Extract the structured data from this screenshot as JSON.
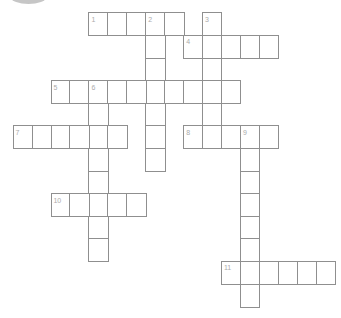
{
  "puzzle": {
    "type": "crossword",
    "colors": {
      "background": "#ffffff",
      "line": "#8f8f8f",
      "number": "#ababab",
      "logo_fragment": "#b4b4b4"
    },
    "grid": {
      "cols": 17,
      "rows": 13,
      "origin_x": 12.6,
      "origin_y": 12.3,
      "cell_w": 18.95,
      "cell_h": 22.6
    },
    "entries": [
      {
        "id": "1-across",
        "dir": "across",
        "row": 0,
        "col": 4,
        "len": 5
      },
      {
        "id": "2-down",
        "dir": "down",
        "row": 0,
        "col": 7,
        "len": 7
      },
      {
        "id": "3-down",
        "dir": "down",
        "row": 0,
        "col": 10,
        "len": 6
      },
      {
        "id": "4-across",
        "dir": "across",
        "row": 1,
        "col": 9,
        "len": 5
      },
      {
        "id": "5-across",
        "dir": "across",
        "row": 3,
        "col": 2,
        "len": 10
      },
      {
        "id": "6-down",
        "dir": "down",
        "row": 3,
        "col": 4,
        "len": 8
      },
      {
        "id": "7-across",
        "dir": "across",
        "row": 5,
        "col": 0,
        "len": 6
      },
      {
        "id": "8-across",
        "dir": "across",
        "row": 5,
        "col": 9,
        "len": 5
      },
      {
        "id": "9-down",
        "dir": "down",
        "row": 5,
        "col": 12,
        "len": 8
      },
      {
        "id": "10-across",
        "dir": "across",
        "row": 8,
        "col": 2,
        "len": 5
      },
      {
        "id": "11-across",
        "dir": "across",
        "row": 11,
        "col": 11,
        "len": 6
      }
    ],
    "numbers": [
      {
        "label": "1",
        "row": 0,
        "col": 4
      },
      {
        "label": "2",
        "row": 0,
        "col": 7
      },
      {
        "label": "3",
        "row": 0,
        "col": 10
      },
      {
        "label": "4",
        "row": 1,
        "col": 9
      },
      {
        "label": "5",
        "row": 3,
        "col": 2
      },
      {
        "label": "6",
        "row": 3,
        "col": 4
      },
      {
        "label": "7",
        "row": 5,
        "col": 0
      },
      {
        "label": "8",
        "row": 5,
        "col": 9
      },
      {
        "label": "9",
        "row": 5,
        "col": 12
      },
      {
        "label": "10",
        "row": 8,
        "col": 2
      },
      {
        "label": "11",
        "row": 11,
        "col": 11
      }
    ]
  }
}
